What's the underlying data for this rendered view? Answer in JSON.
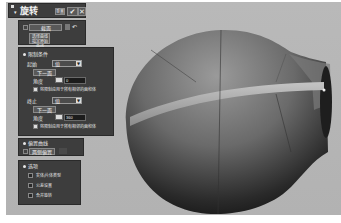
{
  "dialog": {
    "title": "旋转",
    "header_buttons": {
      "reset": "重置",
      "ok_icon": "check-icon",
      "close_icon": "close-icon"
    }
  },
  "section_panel": {
    "curve_select_label": "截面",
    "specify_label_line1": "选择曲线",
    "specify_label_line2": "指定原始曲线"
  },
  "limits": {
    "header": "限制条件",
    "start": {
      "label": "起始",
      "mode": "值",
      "sub_button": "下一面",
      "angle_label": "角度",
      "angle_value": "0",
      "unit": "deg",
      "checkbox_label": "将限制应用于所有相邻的面和体"
    },
    "end": {
      "label": "终止",
      "mode": "值",
      "sub_button": "下一面",
      "angle_label": "角度",
      "angle_value": "360",
      "unit": "deg",
      "checkbox_label": "将限制应用于所有相邻的面和体"
    }
  },
  "offset_curve": {
    "header": "偏置曲线",
    "button_label": "两侧偏置"
  },
  "settings": {
    "header": "选项",
    "options": [
      "实体/片体类型",
      "公差设置",
      "合并旋转"
    ]
  },
  "colors": {
    "panel_bg": "#3d3d3d",
    "viewport_bg": "#b5b5b5",
    "model_dark": "#1a1a1a",
    "model_light": "#8c8c8c"
  }
}
